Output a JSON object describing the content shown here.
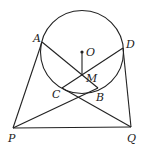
{
  "diagram": {
    "stroke_color": "#222222",
    "circle": {
      "center": "O",
      "cx": 82,
      "cy": 52,
      "r": 41.5
    },
    "points": {
      "A": {
        "x": 42,
        "y": 42,
        "label": "A"
      },
      "D": {
        "x": 123,
        "y": 48,
        "label": "D"
      },
      "O": {
        "x": 82,
        "y": 52,
        "label": "O"
      },
      "M": {
        "x": 82,
        "y": 75,
        "label": "M"
      },
      "C": {
        "x": 62,
        "y": 88,
        "label": "C"
      },
      "B": {
        "x": 98,
        "y": 88,
        "label": "B"
      },
      "P": {
        "x": 13,
        "y": 128,
        "label": "P"
      },
      "Q": {
        "x": 131,
        "y": 127,
        "label": "Q"
      }
    },
    "segments": [
      "PA",
      "QD",
      "PQ",
      "AB",
      "DC",
      "PB",
      "CQ",
      "OM"
    ]
  }
}
